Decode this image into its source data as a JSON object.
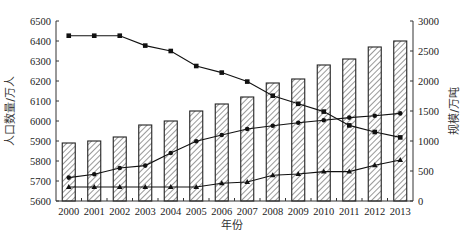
{
  "chart_data": {
    "type": "bar+line",
    "title": "",
    "xlabel": "年份",
    "ylabel": "人口数量/万人",
    "y2label": "规模/万吨",
    "categories": [
      "2000",
      "2001",
      "2002",
      "2003",
      "2004",
      "2005",
      "2006",
      "2007",
      "2008",
      "2009",
      "2010",
      "2011",
      "2012",
      "2013"
    ],
    "ylim": [
      5600,
      6500
    ],
    "y_ticks": [
      5600,
      5700,
      5800,
      5900,
      6000,
      6100,
      6200,
      6300,
      6400,
      6500
    ],
    "y2lim": [
      0,
      3000
    ],
    "y2_ticks": [
      0,
      500,
      1000,
      1500,
      2000,
      2500,
      3000
    ],
    "grid": false,
    "legend": null,
    "series": [
      {
        "name": "人口数量",
        "type": "bar",
        "axis": "left",
        "pattern": "diagonal-hatch",
        "values": [
          5890,
          5900,
          5920,
          5980,
          6000,
          6050,
          6085,
          6120,
          6190,
          6210,
          6280,
          6310,
          6370,
          6400
        ]
      },
      {
        "name": "series-square",
        "type": "line",
        "axis": "right",
        "marker": "square",
        "values": [
          2755,
          2755,
          2755,
          2590,
          2500,
          2250,
          2140,
          1990,
          1755,
          1620,
          1490,
          1260,
          1150,
          1060
        ]
      },
      {
        "name": "series-circle",
        "type": "line",
        "axis": "right",
        "marker": "circle",
        "values": [
          390,
          445,
          550,
          590,
          800,
          995,
          1100,
          1200,
          1255,
          1305,
          1345,
          1390,
          1420,
          1460
        ]
      },
      {
        "name": "series-triangle",
        "type": "line",
        "axis": "right",
        "marker": "triangle",
        "values": [
          233,
          233,
          233,
          233,
          233,
          233,
          295,
          317,
          428,
          450,
          490,
          490,
          595,
          683
        ]
      }
    ]
  },
  "colors": {
    "axis": "#333333",
    "line": "#111111",
    "bar_stroke": "#222222",
    "hatch": "#333333"
  }
}
